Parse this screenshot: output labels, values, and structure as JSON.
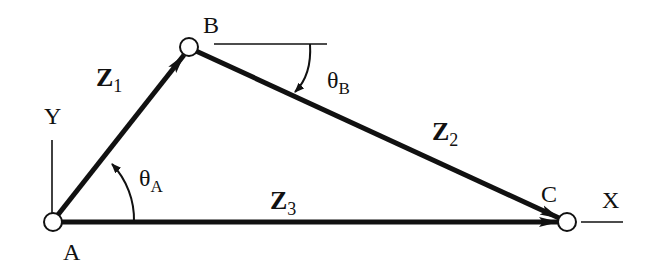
{
  "diagram": {
    "type": "vector-loop-linkage",
    "colors": {
      "line": "#111111",
      "background": "#ffffff",
      "node_fill": "#ffffff"
    },
    "nodes": [
      {
        "id": "A",
        "label": "A",
        "x": 53,
        "y": 222
      },
      {
        "id": "B",
        "label": "B",
        "x": 189,
        "y": 47
      },
      {
        "id": "C",
        "label": "C",
        "x": 567,
        "y": 222
      }
    ],
    "vectors": [
      {
        "id": "Z1",
        "base": "Z",
        "sub": "1",
        "from": "A",
        "to": "B"
      },
      {
        "id": "Z2",
        "base": "Z",
        "sub": "2",
        "from": "B",
        "to": "C"
      },
      {
        "id": "Z3",
        "base": "Z",
        "sub": "3",
        "from": "A",
        "to": "C"
      }
    ],
    "angles": [
      {
        "id": "thetaA",
        "base": "θ",
        "sub": "A",
        "at": "A",
        "direction": "counter-clockwise"
      },
      {
        "id": "thetaB",
        "base": "θ",
        "sub": "B",
        "at": "B",
        "direction": "clockwise"
      }
    ],
    "axes": {
      "x_label": "X",
      "y_label": "Y"
    }
  }
}
